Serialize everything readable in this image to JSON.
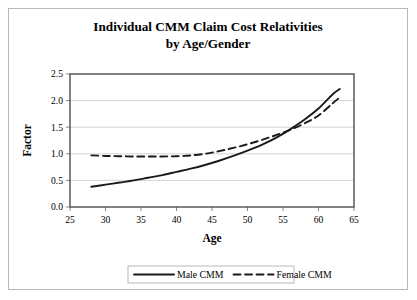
{
  "chart_data": {
    "type": "line",
    "title": "Individual CMM Claim Cost Relativities",
    "subtitle": "by Age/Gender",
    "xlabel": "Age",
    "ylabel": "Factor",
    "xlim": [
      25,
      65
    ],
    "ylim": [
      0.0,
      2.5
    ],
    "xticks": [
      25,
      30,
      35,
      40,
      45,
      50,
      55,
      60,
      65
    ],
    "yticks": [
      "0.0",
      "0.5",
      "1.0",
      "1.5",
      "2.0",
      "2.5"
    ],
    "grid": "horizontal",
    "legend_position": "bottom",
    "x": [
      28,
      30,
      32,
      34,
      36,
      38,
      40,
      42,
      44,
      46,
      48,
      50,
      52,
      54,
      56,
      58,
      60,
      62,
      63
    ],
    "series": [
      {
        "name": "Male CMM",
        "style": "solid",
        "color": "#1a1a1a",
        "values": [
          0.38,
          0.42,
          0.46,
          0.5,
          0.55,
          0.6,
          0.66,
          0.72,
          0.79,
          0.87,
          0.96,
          1.06,
          1.17,
          1.3,
          1.46,
          1.64,
          1.85,
          2.12,
          2.22
        ]
      },
      {
        "name": "Female CMM",
        "style": "dashed",
        "color": "#1a1a1a",
        "values": [
          0.97,
          0.96,
          0.955,
          0.95,
          0.95,
          0.95,
          0.955,
          0.97,
          1.0,
          1.05,
          1.11,
          1.18,
          1.26,
          1.35,
          1.45,
          1.57,
          1.72,
          1.95,
          2.06
        ]
      }
    ]
  },
  "legend": {
    "entries": [
      {
        "label": "Male CMM",
        "style": "solid"
      },
      {
        "label": "Female CMM",
        "style": "dashed"
      }
    ]
  }
}
